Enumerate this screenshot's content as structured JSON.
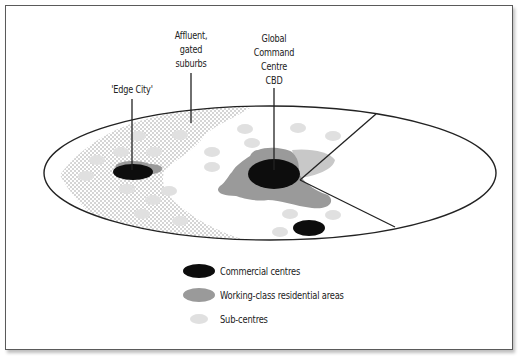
{
  "labels": {
    "edge_city": "'Edge City'",
    "affluent_line1": "Affluent,",
    "affluent_line2": "gated",
    "affluent_line3": "suburbs",
    "cbd_line1": "Global",
    "cbd_line2": "Command",
    "cbd_line3": "Centre",
    "cbd_line4": "CBD"
  },
  "legend": {
    "items": [
      {
        "label": "Commercial centres",
        "color": "#0d0d0d"
      },
      {
        "label": "Working-class residential areas",
        "color": "#9a9a9a"
      },
      {
        "label": "Sub-centres",
        "color": "#e0e0e0"
      }
    ]
  },
  "colors": {
    "commercial": "#0d0d0d",
    "working_class": "#9a9a9a",
    "working_class_light": "#c8c8c8",
    "sub_centre": "#e0e0e0",
    "stipple": "#9c9c9c",
    "outline": "#222222"
  }
}
